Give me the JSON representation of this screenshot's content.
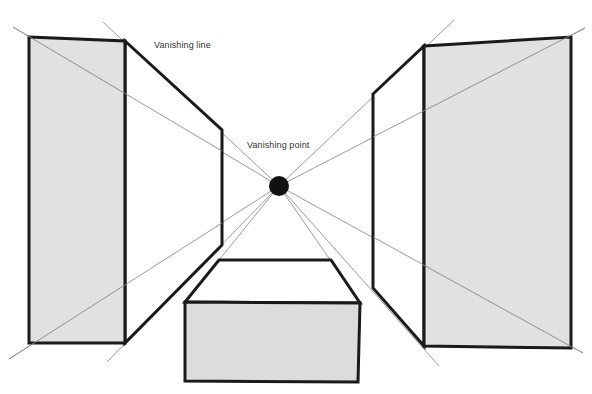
{
  "diagram": {
    "labels": {
      "vanishing_line": "Vanishing line",
      "vanishing_point": "Vanishing point"
    },
    "colors": {
      "background": "#ffffff",
      "face_fill": "#dcdcdc",
      "edge_stroke": "#1a1a1a",
      "guide_stroke": "#9a9a9a",
      "vanishing_point": "#111111"
    },
    "vanishing_point": {
      "x": 279,
      "y": 186,
      "r": 10
    },
    "shapes": [
      {
        "name": "left-block",
        "front_face": "gray",
        "side_face": "white"
      },
      {
        "name": "right-block",
        "front_face": "gray",
        "side_face": "white"
      },
      {
        "name": "bottom-box",
        "front_face": "gray",
        "top_face": "white"
      }
    ]
  }
}
